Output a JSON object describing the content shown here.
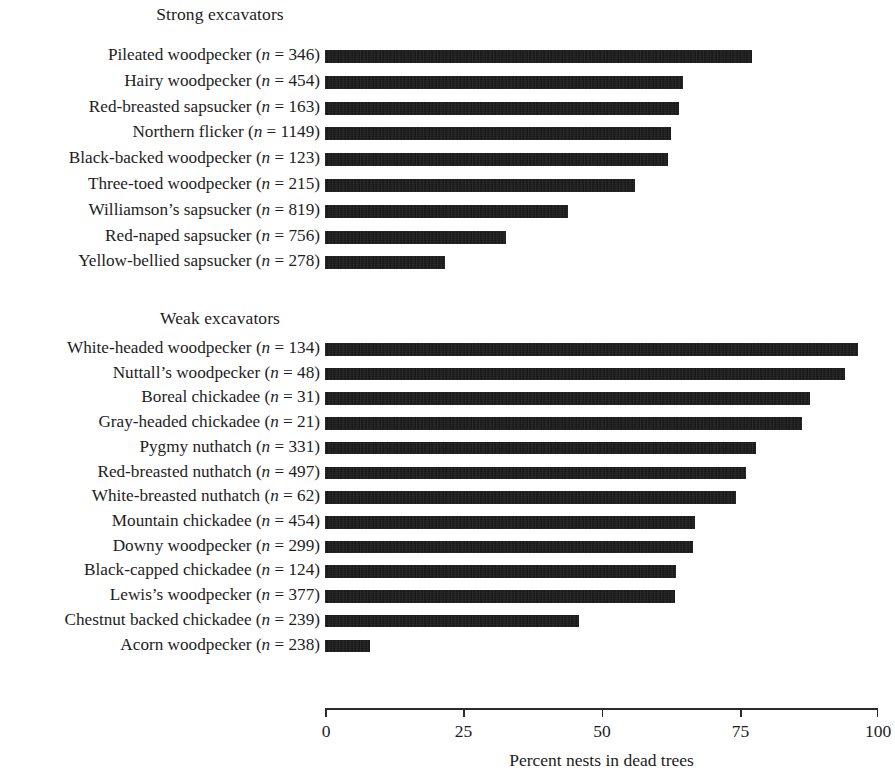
{
  "chart_data": {
    "type": "bar",
    "orientation": "horizontal",
    "title": "",
    "xlabel": "Percent nests in dead trees",
    "ylabel": "",
    "xlim": [
      0,
      100
    ],
    "xticks": [
      0,
      25,
      50,
      75,
      100
    ],
    "xtick_labels": [
      "0",
      "25",
      "50",
      "75",
      "100"
    ],
    "grid": false,
    "legend": null,
    "bar_color": "#111111",
    "groups": [
      {
        "name": "Strong excavators",
        "categories": [
          "Pileated woodpecker (n = 346)",
          "Hairy woodpecker (n = 454)",
          "Red-breasted sapsucker (n = 163)",
          "Northern flicker (n = 1149)",
          "Black-backed woodpecker (n = 123)",
          "Three-toed woodpecker (n = 215)",
          "Williamson's sapsucker (n = 819)",
          "Red-naped sapsucker (n = 756)",
          "Yellow-bellied sapsucker (n = 278)"
        ],
        "species": [
          "Pileated woodpecker",
          "Hairy woodpecker",
          "Red-breasted sapsucker",
          "Northern flicker",
          "Black-backed woodpecker",
          "Three-toed woodpecker",
          "Williamson's sapsucker",
          "Red-naped sapsucker",
          "Yellow-bellied sapsucker"
        ],
        "n": [
          346,
          454,
          163,
          1149,
          123,
          215,
          819,
          756,
          278
        ],
        "values": [
          77.3,
          64.7,
          64.0,
          62.5,
          62.0,
          56.0,
          44.0,
          32.8,
          21.7
        ]
      },
      {
        "name": "Weak excavators",
        "categories": [
          "White-headed woodpecker (n = 134)",
          "Nuttall's woodpecker (n = 48)",
          "Boreal chickadee (n = 31)",
          "Gray-headed chickadee (n = 21)",
          "Pygmy nuthatch (n = 331)",
          "Red-breasted nuthatch (n = 497)",
          "White-breasted nuthatch (n = 62)",
          "Mountain chickadee (n = 454)",
          "Downy woodpecker (n = 299)",
          "Black-capped chickadee (n = 124)",
          "Lewis's woodpecker (n = 377)",
          "Chestnut backed chickadee (n = 239)",
          "Acorn woodpecker (n = 238)"
        ],
        "species": [
          "White-headed woodpecker",
          "Nuttall's woodpecker",
          "Boreal chickadee",
          "Gray-headed chickadee",
          "Pygmy nuthatch",
          "Red-breasted nuthatch",
          "White-breasted nuthatch",
          "Mountain chickadee",
          "Downy woodpecker",
          "Black-capped chickadee",
          "Lewis's woodpecker",
          "Chestnut backed chickadee",
          "Acorn woodpecker"
        ],
        "n": [
          134,
          48,
          31,
          21,
          331,
          497,
          62,
          454,
          299,
          124,
          377,
          239,
          238
        ],
        "values": [
          96.3,
          94.0,
          87.7,
          86.2,
          78.0,
          76.2,
          74.4,
          66.9,
          66.6,
          63.5,
          63.3,
          46.0,
          8.1
        ]
      }
    ]
  },
  "headings": {
    "strong": "Strong excavators",
    "weak": "Weak excavators"
  },
  "axis": {
    "title": "Percent nests in dead trees",
    "tick_0": "0",
    "tick_25": "25",
    "tick_50": "50",
    "tick_75": "75",
    "tick_100": "100"
  },
  "labels": {
    "strong": [
      {
        "name": "Pileated woodpecker",
        "n": "346"
      },
      {
        "name": "Hairy woodpecker",
        "n": "454"
      },
      {
        "name": "Red-breasted sapsucker",
        "n": "163"
      },
      {
        "name": "Northern flicker",
        "n": "1149"
      },
      {
        "name": "Black-backed woodpecker",
        "n": "123"
      },
      {
        "name": "Three-toed woodpecker",
        "n": "215"
      },
      {
        "name": "Williamson’s sapsucker",
        "n": "819"
      },
      {
        "name": "Red-naped sapsucker",
        "n": "756"
      },
      {
        "name": "Yellow-bellied sapsucker",
        "n": "278"
      }
    ],
    "weak": [
      {
        "name": "White-headed woodpecker",
        "n": "134"
      },
      {
        "name": "Nuttall’s woodpecker",
        "n": "48"
      },
      {
        "name": "Boreal chickadee",
        "n": "31"
      },
      {
        "name": "Gray-headed chickadee",
        "n": "21"
      },
      {
        "name": "Pygmy nuthatch",
        "n": "331"
      },
      {
        "name": "Red-breasted nuthatch",
        "n": "497"
      },
      {
        "name": "White-breasted nuthatch",
        "n": "62"
      },
      {
        "name": "Mountain chickadee",
        "n": "454"
      },
      {
        "name": "Downy woodpecker",
        "n": "299"
      },
      {
        "name": "Black-capped chickadee",
        "n": "124"
      },
      {
        "name": "Lewis’s woodpecker",
        "n": "377"
      },
      {
        "name": "Chestnut backed chickadee",
        "n": "239"
      },
      {
        "name": "Acorn woodpecker",
        "n": "238"
      }
    ]
  }
}
